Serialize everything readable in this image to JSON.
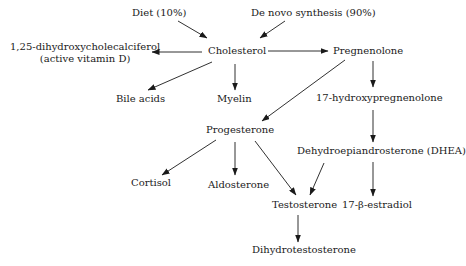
{
  "diagram": {
    "type": "flowchart",
    "title": "",
    "nodes": {
      "diet": "Diet (10%)",
      "denovo": "De novo synthesis (90%)",
      "cholesterol": "Cholesterol",
      "vitd_line1": "1,25-dihydroxycholecalciferol",
      "vitd_line2": "(active vitamin D)",
      "pregnenolone": "Pregnenolone",
      "bile": "Bile acids",
      "myelin": "Myelin",
      "hydroxypreg": "17-hydroxypregnenolone",
      "progesterone": "Progesterone",
      "dhea": "Dehydroepiandrosterone (DHEA)",
      "cortisol": "Cortisol",
      "aldosterone": "Aldosterone",
      "testosterone": "Testosterone",
      "estradiol": "17-β-estradiol",
      "dht": "Dihydrotestosterone"
    },
    "edges": [
      {
        "from": "Diet (10%)",
        "to": "Cholesterol"
      },
      {
        "from": "De novo synthesis (90%)",
        "to": "Cholesterol"
      },
      {
        "from": "Cholesterol",
        "to": "1,25-dihydroxycholecalciferol (active vitamin D)"
      },
      {
        "from": "Cholesterol",
        "to": "Pregnenolone"
      },
      {
        "from": "Cholesterol",
        "to": "Bile acids"
      },
      {
        "from": "Cholesterol",
        "to": "Myelin"
      },
      {
        "from": "Pregnenolone",
        "to": "17-hydroxypregnenolone"
      },
      {
        "from": "Pregnenolone",
        "to": "Progesterone"
      },
      {
        "from": "17-hydroxypregnenolone",
        "to": "Dehydroepiandrosterone (DHEA)"
      },
      {
        "from": "Progesterone",
        "to": "Cortisol"
      },
      {
        "from": "Progesterone",
        "to": "Aldosterone"
      },
      {
        "from": "Progesterone",
        "to": "Testosterone"
      },
      {
        "from": "Dehydroepiandrosterone (DHEA)",
        "to": "Testosterone"
      },
      {
        "from": "Dehydroepiandrosterone (DHEA)",
        "to": "17-β-estradiol"
      },
      {
        "from": "Testosterone",
        "to": "Dihydrotestosterone"
      }
    ],
    "colors": {
      "line": "#1a1a1a",
      "background": "#ffffff"
    }
  }
}
